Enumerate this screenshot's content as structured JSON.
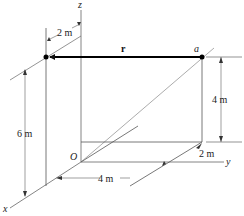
{
  "diagram": {
    "type": "3d-position-vector",
    "axes": {
      "x": "x",
      "y": "y",
      "z": "z",
      "origin": "O"
    },
    "points": {
      "a": "a"
    },
    "vector": {
      "label": "r"
    },
    "dimensions": {
      "top_offset": "2 m",
      "height_left": "6 m",
      "height_right": "4 m",
      "horizontal": "4 m",
      "depth_right": "2 m"
    },
    "colors": {
      "line": "#555555",
      "vector": "#000000",
      "background": "#ffffff"
    }
  }
}
